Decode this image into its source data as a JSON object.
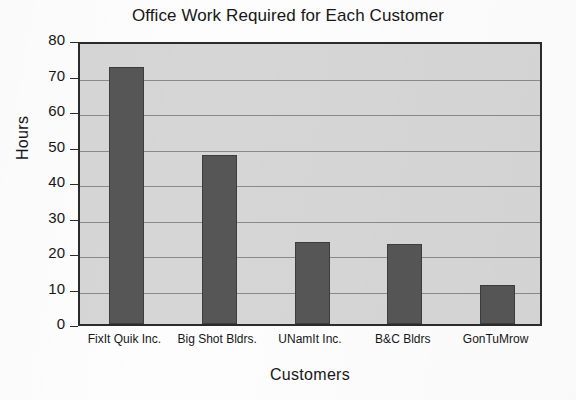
{
  "chart_data": {
    "type": "bar",
    "title": "Office Work Required for Each Customer",
    "xlabel": "Customers",
    "ylabel": "Hours",
    "categories": [
      "FixIt Quik Inc.",
      "Big Shot Bldrs.",
      "UNamIt Inc.",
      "B&C Bldrs",
      "GonTuMrow"
    ],
    "values": [
      72.5,
      47.5,
      23,
      22.5,
      11
    ],
    "ylim": [
      0,
      80
    ],
    "yticks": [
      0,
      10,
      20,
      30,
      40,
      50,
      60,
      70,
      80
    ],
    "ytick_labels": [
      "0",
      "10",
      "20",
      "30",
      "40",
      "50",
      "60",
      "70",
      "80"
    ],
    "grid": "horizontal",
    "legend": "none",
    "series": [
      {
        "name": "Hours",
        "values": [
          72.5,
          47.5,
          23,
          22.5,
          11
        ]
      }
    ],
    "colors": {
      "bar_fill": "#565656",
      "bar_edge": "#3d3d3d",
      "plot_background": "#d6d6d6",
      "axis": "#2b2b2b",
      "gridline": "#8a8a8a",
      "text": "#171717",
      "figure_background": "#fdfdfd"
    }
  }
}
